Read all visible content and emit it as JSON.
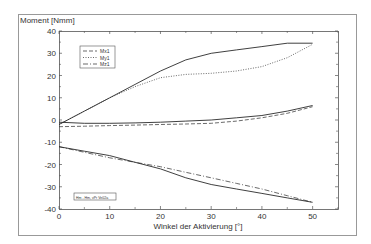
{
  "chart_data": {
    "type": "line",
    "title": "",
    "ylabel": "Moment [Nmm]",
    "xlabel": "Winkel der Aktivierung [°]",
    "xlim": [
      0,
      55
    ],
    "ylim": [
      -40,
      40
    ],
    "xticks": [
      0,
      10,
      20,
      30,
      40,
      50
    ],
    "yticks": [
      40,
      30,
      20,
      10,
      0,
      -10,
      -20,
      -30,
      -40
    ],
    "xtick_labels": [
      "0",
      "10",
      "20",
      "30",
      "40",
      "50"
    ],
    "ytick_labels": [
      "40",
      "30",
      "20",
      "10",
      "0",
      "-10",
      "-20",
      "-30",
      "-40"
    ],
    "grid": false,
    "legend": {
      "position": "upper-left",
      "entries": [
        {
          "label": "Mx1",
          "style": "dashed"
        },
        {
          "label": "My1",
          "style": "dotted"
        },
        {
          "label": "Mz1",
          "style": "dash-dot"
        }
      ]
    },
    "annotation_box": "Hm - Hm, vPr Ve02a",
    "x": [
      0,
      5,
      10,
      15,
      20,
      25,
      30,
      35,
      40,
      45,
      50
    ],
    "series": [
      {
        "name": "Upper solid (measured)",
        "style": "solid",
        "values": [
          -2,
          4,
          10,
          16,
          22,
          27,
          30,
          31.5,
          33,
          34.5,
          34.5
        ]
      },
      {
        "name": "My1",
        "style": "dotted",
        "values": [
          -2,
          4,
          10,
          15,
          19,
          20.5,
          21,
          22,
          24,
          28,
          34
        ]
      },
      {
        "name": "Middle solid (measured)",
        "style": "solid",
        "values": [
          -1,
          -1.5,
          -1.5,
          -1.3,
          -1,
          -0.5,
          0,
          1,
          2,
          4,
          6.5
        ]
      },
      {
        "name": "Mx1",
        "style": "dashed",
        "values": [
          -3,
          -2.8,
          -2.5,
          -2.3,
          -2,
          -1.8,
          -1.5,
          -0.5,
          1,
          3,
          6
        ]
      },
      {
        "name": "Lower solid (measured)",
        "style": "solid",
        "values": [
          -12,
          -14,
          -16,
          -19,
          -22,
          -26,
          -29,
          -31,
          -33,
          -35,
          -37
        ]
      },
      {
        "name": "Mz1",
        "style": "dash-dot",
        "values": [
          -12,
          -14.5,
          -17,
          -19,
          -21,
          -23.5,
          -26,
          -28.5,
          -31,
          -34,
          -37
        ]
      }
    ],
    "colors": {
      "line": "#2a2a2a",
      "axis": "#555555",
      "frame": "#888888",
      "background": "#ffffff"
    }
  }
}
